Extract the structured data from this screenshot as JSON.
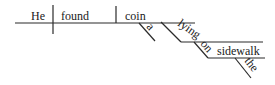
{
  "diagram": {
    "type": "Reed-Kellogg sentence diagram",
    "sentence": "He found a coin lying on the sidewalk",
    "words": {
      "subject": "He",
      "verb": "found",
      "object": "coin",
      "object_modifier": "a",
      "participle": "lying",
      "preposition": "on",
      "prep_object": "sidewalk",
      "prep_object_modifier": "the"
    },
    "colors": {
      "line": "#2a2a2a",
      "text": "#1a1a1a",
      "background": "#ffffff"
    }
  }
}
